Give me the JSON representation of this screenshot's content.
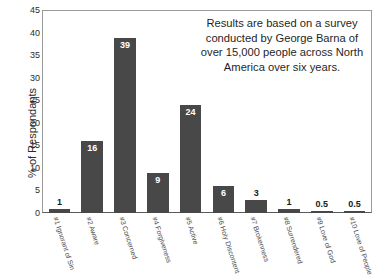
{
  "chart_data": {
    "type": "bar",
    "title": "",
    "xlabel": "",
    "ylabel": "% of Respondants",
    "ylim": [
      0,
      45
    ],
    "yticks": [
      0,
      5,
      10,
      15,
      20,
      25,
      30,
      35,
      40,
      45
    ],
    "grid": false,
    "legend": "none",
    "categories": [
      "#1 Ignorant of Sin",
      "#2 Aware",
      "#3 Concerned",
      "#4 Forgiveness",
      "#5 Active",
      "#6 Holy Discontent",
      "#7 Brokenness",
      "#8 Surrendered",
      "#9 Love of God",
      "#10 Love of People"
    ],
    "values": [
      1,
      16,
      39,
      9,
      24,
      6,
      3,
      1,
      0.5,
      0.5
    ],
    "value_labels": [
      "1",
      "16",
      "39",
      "9",
      "24",
      "6",
      "3",
      "1",
      "0.5",
      "0.5"
    ],
    "bar_color": "#484848",
    "annotation": "Results are based on a survey conducted by George Barna of over 15,000 people across North America over six years."
  }
}
